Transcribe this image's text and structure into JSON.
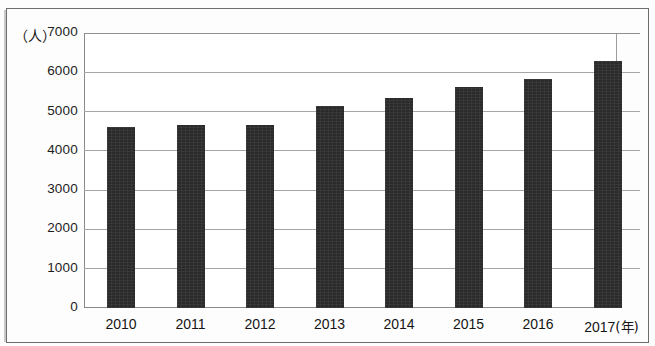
{
  "chart_data": {
    "type": "bar",
    "title": "",
    "subtitle": "",
    "xlabel": "年",
    "ylabel": "人",
    "y_unit_label": "（人）",
    "x_unit_label": "(年)",
    "categories": [
      "2010",
      "2011",
      "2012",
      "2013",
      "2014",
      "2015",
      "2016",
      "2017"
    ],
    "values": [
      4600,
      4650,
      4650,
      5130,
      5350,
      5630,
      5830,
      6300
    ],
    "series": [
      {
        "name": "人数",
        "values": [
          4600,
          4650,
          4650,
          5130,
          5350,
          5630,
          5830,
          6300
        ]
      }
    ],
    "ylim": [
      0,
      7000
    ],
    "y_ticks": [
      0,
      1000,
      2000,
      3000,
      4000,
      5000,
      6000,
      7000
    ],
    "y_tick_labels": [
      "0",
      "1000",
      "2000",
      "3000",
      "4000",
      "5000",
      "6000",
      "7000"
    ],
    "grid": true,
    "grid_axis": "y",
    "legend": false,
    "legend_position": "none",
    "bar_color": "#2b2b2b",
    "background_color": "#ffffff",
    "axis_color": "#8a8a8a",
    "annotations": []
  }
}
